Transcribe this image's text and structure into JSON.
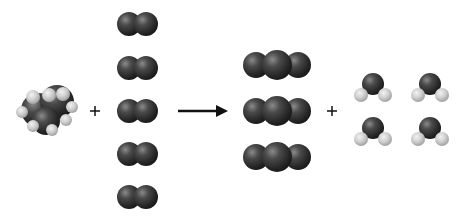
{
  "diagram": {
    "equation": "C3H8 + 5 O2 → 3 CO2 + 4 H2O",
    "colors": {
      "carbon": "#3a3a3a",
      "oxygen": "#3a3a3a",
      "hydrogen": "#c8c8c8",
      "arrow": "#111111",
      "background": "#ffffff"
    },
    "reactants": [
      {
        "name": "propane",
        "formula": "C3H8",
        "count": 1
      },
      {
        "name": "oxygen",
        "formula": "O2",
        "count": 5
      }
    ],
    "products": [
      {
        "name": "carbon-dioxide",
        "formula": "CO2",
        "count": 3
      },
      {
        "name": "water",
        "formula": "H2O",
        "count": 4
      }
    ],
    "symbols": {
      "plus_1": "+",
      "plus_2": "+"
    }
  }
}
